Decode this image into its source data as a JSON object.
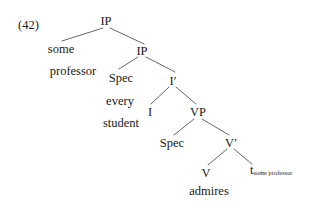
{
  "figure": {
    "example_number": "(42)",
    "type": "syntax-tree",
    "caption": "",
    "background_color": "#ffffff",
    "line_color": "#555555",
    "text_color": "#1a1a1a"
  },
  "nodes": {
    "ip_top": "IP",
    "ip_lower": "IP",
    "spec_ip": "Spec",
    "i_bar": "I′",
    "i_head": "I",
    "vp": "VP",
    "spec_vp": "Spec",
    "v_bar": "V′",
    "v_head": "V"
  },
  "terminals": {
    "some": "some",
    "professor": "professor",
    "every": "every",
    "student": "student",
    "admires": "admires"
  },
  "trace": {
    "symbol": "t",
    "subscript": "some professor"
  }
}
